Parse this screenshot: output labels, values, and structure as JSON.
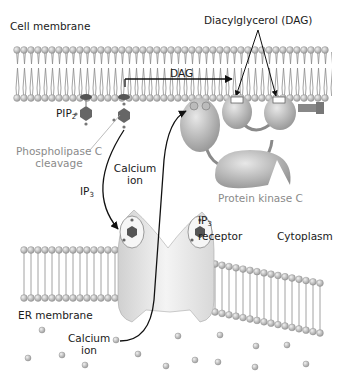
{
  "diagram": {
    "labels": {
      "cell_membrane": "Cell membrane",
      "dag_top": "Diacylglycerol (DAG)",
      "dag_arrow": "DAG",
      "pip2_main": "PIP",
      "pip2_sub": "2",
      "plc_line1": "Phospholipase C",
      "plc_line2": "cleavage",
      "calcium_upper_line1": "Calcium",
      "calcium_upper_line2": "ion",
      "ip3_main": "IP",
      "ip3_sub": "3",
      "pkc": "Protein kinase C",
      "ip3r_main": "IP",
      "ip3r_sub": "3",
      "ip3r_line2": "receptor",
      "cytoplasm": "Cytoplasm",
      "er_membrane": "ER membrane",
      "calcium_lower_line1": "Calcium",
      "calcium_lower_line2": "ion"
    },
    "colors": {
      "lipid_head": "#bdbdbd",
      "lipid_tail": "#8c8c8c",
      "protein": "#c4c4c4",
      "receptor": "#e6e6e6",
      "text": "#1a1a1a",
      "muted_text": "#8a8a8a",
      "arrow": "#111111"
    }
  }
}
